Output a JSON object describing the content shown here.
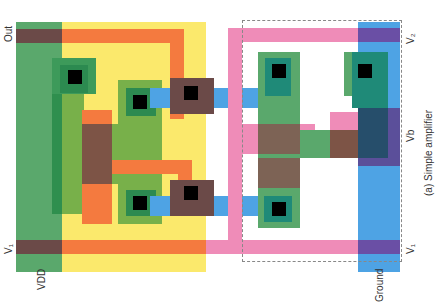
{
  "diagram": {
    "caption": "(a) Simple amplifier",
    "labels": {
      "out": "Out",
      "v1_left": "V₁",
      "vdd": "VDD",
      "v2": "V₂",
      "vb": "Vb",
      "v1_right": "V₁",
      "ground": "Ground"
    },
    "colors": {
      "diffusion_green": "#5aa86c",
      "nwell_yellow": "#fbe96c",
      "poly_orange": "#f47a3f",
      "poly_pink": "#ef8cb8",
      "metal_blue": "#4ea3e4",
      "contact_black": "#000000",
      "overlap_purple": "#6a4fa5",
      "overlap_brown": "#7d5446"
    }
  }
}
